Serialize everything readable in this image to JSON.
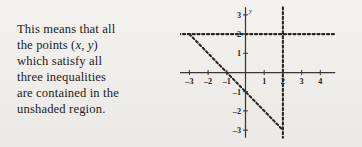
{
  "prose": {
    "lines": [
      "This means that all",
      "the points (x, y)",
      "which satisfy all",
      "three inequalities",
      "are contained in the",
      "unshaded region."
    ],
    "line1": "This means that all",
    "line2_pre": "the points (",
    "line2_var_x": "x",
    "line2_mid": ", ",
    "line2_var_y": "y",
    "line2_post": ")",
    "line3": "which satisfy all",
    "line4": "three inequalities",
    "line5": "are contained in the",
    "line6": "unshaded region."
  },
  "chart_data": {
    "type": "line",
    "title": "",
    "xlabel": "x",
    "ylabel": "y",
    "xlim": [
      -3.6,
      4.8
    ],
    "ylim": [
      -3.4,
      3.4
    ],
    "grid": false,
    "legend": null,
    "x_ticks": [
      -3,
      -2,
      -1,
      1,
      2,
      3,
      4
    ],
    "x_tick_labels": [
      "-3",
      "-2",
      "-1",
      "1",
      "2",
      "3",
      "4"
    ],
    "y_ticks": [
      3,
      2,
      1,
      -1,
      -2,
      -3
    ],
    "y_tick_labels": [
      "3",
      "2",
      "1",
      "-1",
      "-2",
      "-3"
    ],
    "axis_names": {
      "x": "x",
      "y": "y"
    },
    "series": [
      {
        "name": "x + y = -1",
        "style": "dashed",
        "color": "#2a2723",
        "points": [
          [
            -3,
            2
          ],
          [
            2,
            -3
          ]
        ],
        "x_intercept": -1,
        "y_intercept": -1
      },
      {
        "name": "y = 2",
        "style": "dashed",
        "color": "#2a2723",
        "points": [
          [
            -3.6,
            2
          ],
          [
            4.8,
            2
          ]
        ]
      },
      {
        "name": "x = 2",
        "style": "dashed",
        "color": "#2a2723",
        "points": [
          [
            2,
            3.4
          ],
          [
            2,
            -3.4
          ]
        ]
      }
    ],
    "axes_color": "#3a3631",
    "background": "#f0eeeb"
  }
}
